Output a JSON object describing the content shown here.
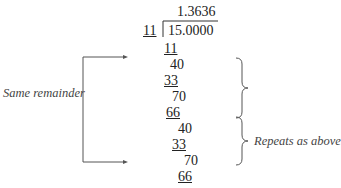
{
  "division": {
    "quotient": "1.3636",
    "divisor": "11",
    "dividend": "15.0000",
    "steps": [
      {
        "value": "11",
        "underlined": true
      },
      {
        "value": "40",
        "underlined": false
      },
      {
        "value": "33",
        "underlined": true
      },
      {
        "value": "70",
        "underlined": false
      },
      {
        "value": "66",
        "underlined": true
      },
      {
        "value": "40",
        "underlined": false
      },
      {
        "value": "33",
        "underlined": true
      },
      {
        "value": "70",
        "underlined": false
      },
      {
        "value": "66",
        "underlined": true
      }
    ]
  },
  "annotations": {
    "same_remainder": "Same remainder",
    "repeats": "Repeats as above"
  }
}
